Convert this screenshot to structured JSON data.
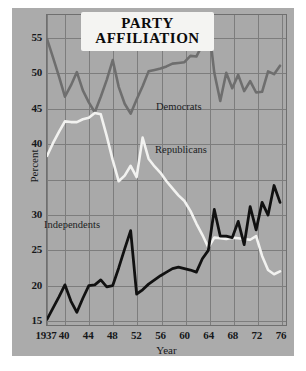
{
  "chart_data": {
    "type": "line",
    "title": "PARTY AFFILIATION",
    "title_line1": "PARTY",
    "title_line2": "AFFILIATION",
    "xlabel": "Year",
    "ylabel": "Percent",
    "xlim": [
      1937,
      1977
    ],
    "ylim": [
      14.2,
      58.2
    ],
    "grid": true,
    "legend_position": "inline-annotations",
    "xticks": [
      1937,
      1940,
      1944,
      1948,
      1952,
      1956,
      1960,
      1964,
      1968,
      1972,
      1976
    ],
    "xtick_labels": [
      "1937",
      "40",
      "44",
      "48",
      "52",
      "56",
      "60",
      "64",
      "68",
      "72",
      "76"
    ],
    "yticks": [
      55,
      50,
      45,
      40,
      30,
      25,
      20,
      15
    ],
    "ytick_labels": [
      "55",
      "50",
      "45",
      "40",
      "30",
      "25",
      "20",
      "15"
    ],
    "ygridlines": [
      55,
      50,
      45,
      40,
      35,
      30,
      25,
      20,
      15
    ],
    "colors": {
      "democrats": "#6e6e6e",
      "republicans": "#f2f2f0",
      "independents": "#111111",
      "plot_background": "#a9a9a9",
      "panel_background": "#ababab",
      "gridline": "#7d7d7d",
      "axis": "#6f6f6f",
      "page_background": "#ffffff",
      "text": "#16181a"
    },
    "series": [
      {
        "name": "Democrats",
        "color": "#6e6e6e",
        "x": [
          1937,
          1938,
          1939,
          1940,
          1941,
          1942,
          1943,
          1944,
          1945,
          1946,
          1947,
          1948,
          1949,
          1950,
          1951,
          1952,
          1953,
          1954,
          1955,
          1956,
          1957,
          1958,
          1959,
          1960,
          1961,
          1962,
          1963,
          1964,
          1965,
          1966,
          1967,
          1968,
          1969,
          1970,
          1971,
          1972,
          1973,
          1974,
          1975,
          1976
        ],
        "values": [
          54.8,
          52.2,
          49.5,
          46.6,
          48.2,
          50.1,
          47.5,
          45.8,
          44.4,
          46.6,
          49.0,
          51.8,
          48.0,
          45.6,
          44.2,
          46.2,
          48.1,
          50.2,
          50.4,
          50.6,
          50.9,
          51.3,
          51.4,
          51.5,
          52.4,
          52.3,
          54.0,
          57.2,
          50.0,
          46.0,
          50.0,
          47.8,
          49.7,
          47.4,
          48.8,
          47.2,
          47.3,
          50.2,
          49.8,
          51.0
        ]
      },
      {
        "name": "Republicans",
        "color": "#f2f2f0",
        "x": [
          1937,
          1938,
          1939,
          1940,
          1941,
          1942,
          1943,
          1944,
          1945,
          1946,
          1947,
          1948,
          1949,
          1950,
          1951,
          1952,
          1953,
          1954,
          1955,
          1956,
          1957,
          1958,
          1959,
          1960,
          1961,
          1962,
          1963,
          1964,
          1965,
          1966,
          1967,
          1968,
          1969,
          1970,
          1971,
          1972,
          1973,
          1974,
          1975,
          1976
        ],
        "values": [
          38.2,
          40.0,
          41.6,
          43.1,
          43.0,
          43.0,
          43.4,
          43.6,
          44.3,
          44.1,
          41.0,
          37.6,
          34.6,
          35.4,
          36.8,
          35.2,
          40.8,
          37.8,
          36.7,
          35.8,
          34.6,
          33.6,
          32.6,
          31.8,
          30.4,
          28.6,
          27.0,
          25.2,
          26.6,
          26.5,
          26.4,
          26.6,
          26.5,
          26.4,
          26.3,
          26.8,
          24.0,
          22.0,
          21.4,
          21.8
        ]
      },
      {
        "name": "Independents",
        "color": "#111111",
        "x": [
          1937,
          1938,
          1939,
          1940,
          1941,
          1942,
          1943,
          1944,
          1945,
          1946,
          1947,
          1948,
          1949,
          1950,
          1951,
          1952,
          1953,
          1954,
          1955,
          1956,
          1957,
          1958,
          1959,
          1960,
          1961,
          1962,
          1963,
          1964,
          1965,
          1966,
          1967,
          1968,
          1969,
          1970,
          1971,
          1972,
          1973,
          1974,
          1975,
          1976
        ],
        "values": [
          15.0,
          16.6,
          18.2,
          19.9,
          17.6,
          16.0,
          18.0,
          19.8,
          19.9,
          20.6,
          19.6,
          19.8,
          22.3,
          25.0,
          27.6,
          18.6,
          19.2,
          20.0,
          20.6,
          21.2,
          21.7,
          22.2,
          22.4,
          22.2,
          22.0,
          21.7,
          23.6,
          24.8,
          30.6,
          26.8,
          26.8,
          26.6,
          28.9,
          25.6,
          31.0,
          27.7,
          31.6,
          29.8,
          34.0,
          31.6
        ]
      }
    ],
    "annotations": [
      {
        "text": "Democrats",
        "x": 1959,
        "y": 47.9
      },
      {
        "text": "Republicans",
        "x": 1959,
        "y": 42.0
      },
      {
        "text": "Independents",
        "x": 1941,
        "y": 26.6
      }
    ]
  }
}
